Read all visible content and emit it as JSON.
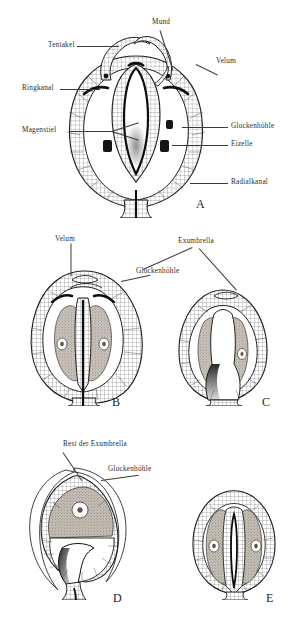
{
  "plate": {
    "title": "Entwicklungsstadien einer Meduse (Längsschnitte)",
    "background_color": "#ffffff",
    "ink_color": "#1a1a1a",
    "tissue_fill_color": "#a8a29a",
    "cavity_fill_color": "#ffffff"
  },
  "figures": [
    {
      "letter": "A",
      "caption_letter": "A",
      "labels": [
        {
          "text": "Mund"
        },
        {
          "text": "Tentakel"
        },
        {
          "text": "Velum"
        },
        {
          "text": "Ringkanal"
        },
        {
          "text": "Magenstiel"
        },
        {
          "text": "Glockenhöhle"
        },
        {
          "text": "Eizelle"
        },
        {
          "text": "Radialkanal"
        }
      ]
    },
    {
      "letter": "B",
      "caption_letter": "B",
      "labels": [
        {
          "text": "Velum"
        },
        {
          "text": "Glockenhöhle"
        }
      ]
    },
    {
      "letter": "C",
      "caption_letter": "C",
      "labels": [
        {
          "text": "Exumbrella"
        }
      ]
    },
    {
      "letter": "D",
      "caption_letter": "D",
      "labels": [
        {
          "text": "Rest der Exumbrella"
        },
        {
          "text": "Glockenhöhle"
        }
      ]
    },
    {
      "letter": "E",
      "caption_letter": "E",
      "labels": []
    }
  ],
  "label_text": {
    "mund": "Mund",
    "tentakel": "Tentakel",
    "velum_a": "Velum",
    "ringkanal": "Ringkanal",
    "magenstiel": "Magenstiel",
    "glockenhoehle_a": "Glockenhöhle",
    "eizelle": "Eizelle",
    "radialkanal": "Radialkanal",
    "velum_b": "Velum",
    "glockenhoehle_b": "Glockenhöhle",
    "exumbrella_c": "Exumbrella",
    "rest_der_exumbrella_d": "Rest der Exumbrella",
    "glockenhoehle_d": "Glockenhöhle"
  },
  "figure_letters": {
    "a": "A",
    "b": "B",
    "c": "C",
    "d": "D",
    "e": "E"
  }
}
